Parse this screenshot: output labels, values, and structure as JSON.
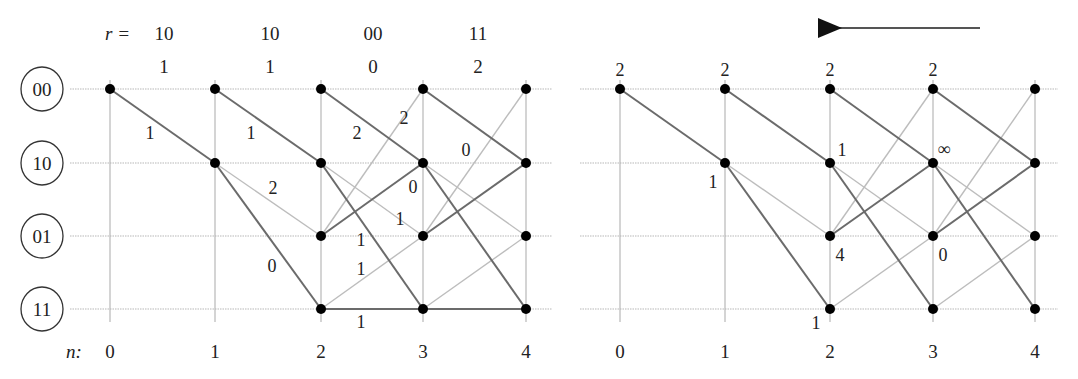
{
  "diagram": {
    "type": "viterbi-trellis",
    "states": [
      "00",
      "10",
      "01",
      "11"
    ],
    "time_label": "n:",
    "time_steps": [
      "0",
      "1",
      "2",
      "3",
      "4"
    ],
    "received_label": "r =",
    "received": [
      "10",
      "10",
      "00",
      "11"
    ],
    "received_hamming": [
      "1",
      "1",
      "0",
      "2"
    ],
    "left_trellis": {
      "title": "forward pass with branch metrics",
      "branch_labels": [
        {
          "from": [
            0,
            "00"
          ],
          "to": [
            1,
            "10"
          ],
          "label": "1"
        },
        {
          "from": [
            1,
            "00"
          ],
          "to": [
            2,
            "10"
          ],
          "label": "1"
        },
        {
          "from": [
            1,
            "10"
          ],
          "to": [
            2,
            "01"
          ],
          "label": "2"
        },
        {
          "from": [
            1,
            "10"
          ],
          "to": [
            2,
            "11"
          ],
          "label": "0"
        },
        {
          "from": [
            2,
            "00"
          ],
          "to": [
            3,
            "10"
          ],
          "label": "2"
        },
        {
          "from": [
            2,
            "01"
          ],
          "to": [
            3,
            "00"
          ],
          "label": "2"
        },
        {
          "from": [
            2,
            "10"
          ],
          "to": [
            3,
            "01"
          ],
          "label": "1"
        },
        {
          "from": [
            2,
            "01"
          ],
          "to": [
            3,
            "10"
          ],
          "label": "0"
        },
        {
          "from": [
            2,
            "10"
          ],
          "to": [
            3,
            "11"
          ],
          "label": "1"
        },
        {
          "from": [
            2,
            "11"
          ],
          "to": [
            3,
            "01"
          ],
          "label": "1"
        },
        {
          "from": [
            2,
            "11"
          ],
          "to": [
            3,
            "11"
          ],
          "label": "1"
        },
        {
          "from": [
            3,
            "00"
          ],
          "to": [
            4,
            "10"
          ],
          "label": "0"
        }
      ]
    },
    "right_trellis": {
      "direction_arrow": "right-to-left",
      "node_metrics": [
        {
          "node": [
            0,
            "00"
          ],
          "value": "2"
        },
        {
          "node": [
            1,
            "00"
          ],
          "value": "2"
        },
        {
          "node": [
            2,
            "00"
          ],
          "value": "2"
        },
        {
          "node": [
            3,
            "00"
          ],
          "value": "2"
        },
        {
          "node": [
            1,
            "10"
          ],
          "value": "1"
        },
        {
          "node": [
            2,
            "10"
          ],
          "value": "1"
        },
        {
          "node": [
            3,
            "10"
          ],
          "value": "∞"
        },
        {
          "node": [
            2,
            "01"
          ],
          "value": "4"
        },
        {
          "node": [
            3,
            "01"
          ],
          "value": "0"
        },
        {
          "node": [
            2,
            "11"
          ],
          "value": "1"
        }
      ]
    },
    "legend": {
      "dark_edge": "input bit 1 transition",
      "light_edge": "input bit 0 transition"
    },
    "colors": {
      "node": "#000000",
      "dark_edge": "#6b6b6b",
      "light_edge": "#bdbdbd",
      "grid": "#b8b8b8"
    }
  }
}
